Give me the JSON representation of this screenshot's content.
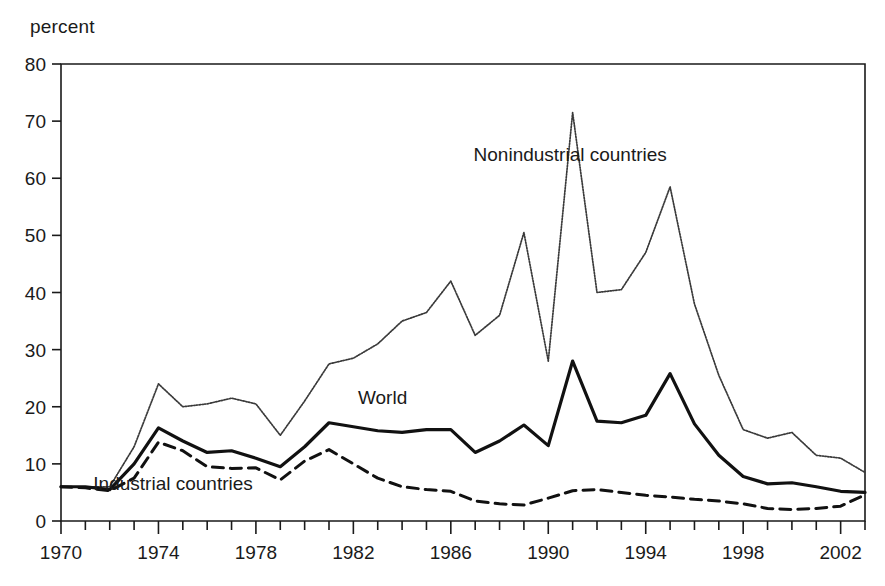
{
  "axis_unit_label": "percent",
  "chart_data": {
    "type": "line",
    "title": "",
    "subtitle": "",
    "xlabel": "",
    "ylabel": "percent",
    "ylim": [
      0,
      80
    ],
    "xlim": [
      1970,
      2003
    ],
    "ytick_values": [
      0,
      10,
      20,
      30,
      40,
      50,
      60,
      70,
      80
    ],
    "ytick_labels": [
      "0",
      "10",
      "20",
      "30",
      "40",
      "50",
      "60",
      "70",
      "80"
    ],
    "xtick_labels": [
      "1970",
      "1974",
      "1978",
      "1982",
      "1986",
      "1990",
      "1994",
      "1998",
      "2002"
    ],
    "xtick_label_values": [
      1970,
      1974,
      1978,
      1982,
      1986,
      1990,
      1994,
      1998,
      2002
    ],
    "xtick_minor_step": 1,
    "grid": false,
    "legend_position": "inline-annotations",
    "x": [
      1970,
      1971,
      1972,
      1973,
      1974,
      1975,
      1976,
      1977,
      1978,
      1979,
      1980,
      1981,
      1982,
      1983,
      1984,
      1985,
      1986,
      1987,
      1988,
      1989,
      1990,
      1991,
      1992,
      1993,
      1994,
      1995,
      1996,
      1997,
      1998,
      1999,
      2000,
      2001,
      2002,
      2003
    ],
    "series": [
      {
        "name": "Nonindustrial countries",
        "style": "dotted",
        "color": "#3a3a3a",
        "label_x": 1990.9,
        "label_y": 63.0,
        "values": [
          6.0,
          6.0,
          6.0,
          13.0,
          24.0,
          20.0,
          20.5,
          21.5,
          20.5,
          15.0,
          21.0,
          27.5,
          28.5,
          31.0,
          35.0,
          36.5,
          42.0,
          32.5,
          36.0,
          50.5,
          28.0,
          71.5,
          40.0,
          40.5,
          47.0,
          58.5,
          38.0,
          25.5,
          16.0,
          14.5,
          15.5,
          11.5,
          11.0,
          8.5
        ]
      },
      {
        "name": "World",
        "style": "solid",
        "color": "#111111",
        "label_x": 1983.2,
        "label_y": 20.5,
        "values": [
          6.0,
          6.0,
          5.5,
          10.0,
          16.3,
          14.0,
          12.0,
          12.3,
          11.0,
          9.5,
          13.0,
          17.2,
          16.5,
          15.8,
          15.5,
          16.0,
          16.0,
          12.0,
          14.0,
          16.8,
          13.2,
          28.0,
          17.5,
          17.2,
          18.5,
          25.8,
          17.0,
          11.5,
          7.8,
          6.5,
          6.7,
          6.0,
          5.2,
          5.0
        ]
      },
      {
        "name": "Industrial countries",
        "style": "dashed",
        "color": "#111111",
        "label_x": 1974.6,
        "label_y": 5.4,
        "values": [
          6.0,
          5.8,
          5.3,
          7.5,
          13.8,
          12.3,
          9.5,
          9.2,
          9.3,
          7.2,
          10.5,
          12.5,
          10.0,
          7.5,
          6.0,
          5.5,
          5.2,
          3.5,
          3.0,
          2.8,
          4.0,
          5.3,
          5.5,
          5.0,
          4.5,
          4.2,
          3.8,
          3.5,
          3.0,
          2.2,
          2.0,
          2.2,
          2.6,
          4.6
        ]
      }
    ]
  }
}
